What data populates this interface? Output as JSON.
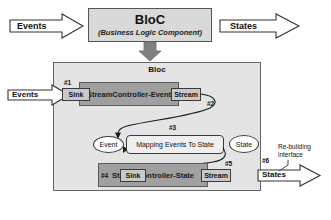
{
  "diagram": {
    "title_box": {
      "name": "BloC",
      "subtitle": "(Business Logic Component)"
    },
    "top_arrows": {
      "events_label": "Events",
      "states_label": "States"
    },
    "container": {
      "label": "Bloc"
    },
    "event_row": {
      "step": "#1",
      "sink_label": "Sink",
      "controller_label": "StreamController-Event",
      "stream_label": "Stream",
      "stream_step": "#2"
    },
    "mapping_row": {
      "step": "#3",
      "event_ellipse": "Event",
      "mapping_label": "Mapping Events To State",
      "state_ellipse": "State"
    },
    "state_row": {
      "step": "#4",
      "sink_label": "Sink",
      "controller_label": "StreamController-State",
      "stream_label": "Stream",
      "stream_step": "#5"
    },
    "output": {
      "step": "#6",
      "annotation_line1": "Re-building",
      "annotation_line2": "interface",
      "states_label": "States",
      "events_label": "Events"
    },
    "colors": {
      "title_box_fill": "#d9d9d9",
      "container_fill": "#e4e4e4",
      "controller_fill": "#a0a0a0",
      "port_fill": "#c9c9c9",
      "mapping_fill": "#efefef",
      "down_arrow_fill": "#808080",
      "stroke": "#3a3a3a"
    }
  }
}
